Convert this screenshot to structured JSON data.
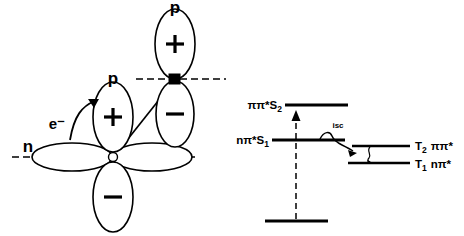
{
  "figure": {
    "colors": {
      "ink": "#000000",
      "paper": "#ffffff"
    }
  },
  "orbital_panel": {
    "name": "orbital-diagram",
    "labels": {
      "p_center": "p",
      "p_upper": "p",
      "n_orbital": "n",
      "electron": "e⁻",
      "plus_center": "+",
      "minus_center": "−",
      "plus_upper": "+",
      "minus_upper": "−"
    },
    "lobes": [
      {
        "id": "n-left-lobe",
        "sign": "",
        "orientation": "horizontal"
      },
      {
        "id": "n-right-lobe",
        "sign": "",
        "orientation": "horizontal"
      },
      {
        "id": "p-center-upper-lobe",
        "sign": "+",
        "orientation": "vertical"
      },
      {
        "id": "p-center-lower-lobe",
        "sign": "−",
        "orientation": "vertical"
      },
      {
        "id": "p-upper-upper-lobe",
        "sign": "+",
        "orientation": "vertical"
      },
      {
        "id": "p-upper-lower-lobe",
        "sign": "−",
        "orientation": "vertical"
      }
    ]
  },
  "jablonski_panel": {
    "name": "jablonski-diagram",
    "singlet_levels": [
      {
        "id": "S2",
        "label_main": "ππ*S",
        "label_sub": "2"
      },
      {
        "id": "S1",
        "label_main": "nπ*S",
        "label_sub": "1"
      }
    ],
    "triplet_levels": [
      {
        "id": "T2",
        "label_main": "T",
        "label_sub": "2",
        "config": "ππ*"
      },
      {
        "id": "T1",
        "label_main": "T",
        "label_sub": "1",
        "config": "nπ*"
      }
    ],
    "ground_state": {
      "id": "S0",
      "label": ""
    },
    "processes": [
      {
        "id": "absorption",
        "label": "",
        "style": "dashed-vertical-arrow"
      },
      {
        "id": "intersystem-crossing",
        "label": "isc",
        "style": "wavy-arrow"
      },
      {
        "id": "triplet-relaxation",
        "label": "",
        "style": "wavy-arrow-small"
      }
    ]
  }
}
